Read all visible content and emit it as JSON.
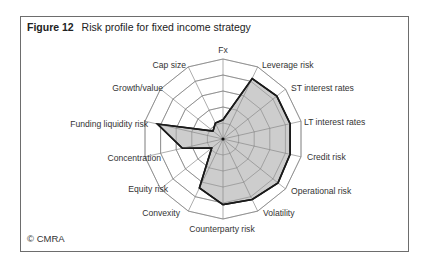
{
  "figure": {
    "number_label": "Figure 12",
    "title": "Risk profile for fixed income strategy",
    "copyright": "© CMRA"
  },
  "colors": {
    "frame": "#6d6d6d",
    "grid": "#8a8a8a",
    "fill": "#c4c4c4",
    "outline": "#1a1a1a",
    "text": "#333333"
  },
  "chart_data": {
    "type": "radar",
    "title": "Risk profile for fixed income strategy",
    "axes": [
      "Fx",
      "Leverage risk",
      "ST interest rates",
      "LT interest rates",
      "Credit risk",
      "Operational risk",
      "Volatility",
      "Counterparty risk",
      "Convexity",
      "Equity risk",
      "Concentration",
      "Funding liquidity risk",
      "Growth/value",
      "Cap size"
    ],
    "series": [
      {
        "name": "Fixed income strategy",
        "values": [
          1.2,
          4.2,
          4.3,
          4.3,
          4.3,
          4.4,
          4.2,
          4.1,
          3.4,
          0.9,
          2.6,
          4.2,
          0.8,
          1.1
        ]
      }
    ],
    "rings": 5,
    "range": [
      0,
      5
    ],
    "grid": true,
    "legend": false,
    "tick_labels_shown": false
  },
  "layout": {
    "center": [
      223,
      139
    ],
    "radius": 80,
    "label_positions": [
      {
        "x": 223,
        "y": 53,
        "anchor": "middle"
      },
      {
        "x": 262,
        "y": 68,
        "anchor": "start"
      },
      {
        "x": 291,
        "y": 91,
        "anchor": "start"
      },
      {
        "x": 304,
        "y": 125,
        "anchor": "start"
      },
      {
        "x": 307,
        "y": 160,
        "anchor": "start"
      },
      {
        "x": 291,
        "y": 194,
        "anchor": "start"
      },
      {
        "x": 263,
        "y": 216,
        "anchor": "start"
      },
      {
        "x": 222,
        "y": 232,
        "anchor": "middle"
      },
      {
        "x": 180,
        "y": 216,
        "anchor": "end"
      },
      {
        "x": 168,
        "y": 192,
        "anchor": "end"
      },
      {
        "x": 161,
        "y": 161,
        "anchor": "end"
      },
      {
        "x": 148,
        "y": 127,
        "anchor": "end"
      },
      {
        "x": 163,
        "y": 91,
        "anchor": "end"
      },
      {
        "x": 186,
        "y": 68,
        "anchor": "end"
      }
    ]
  }
}
